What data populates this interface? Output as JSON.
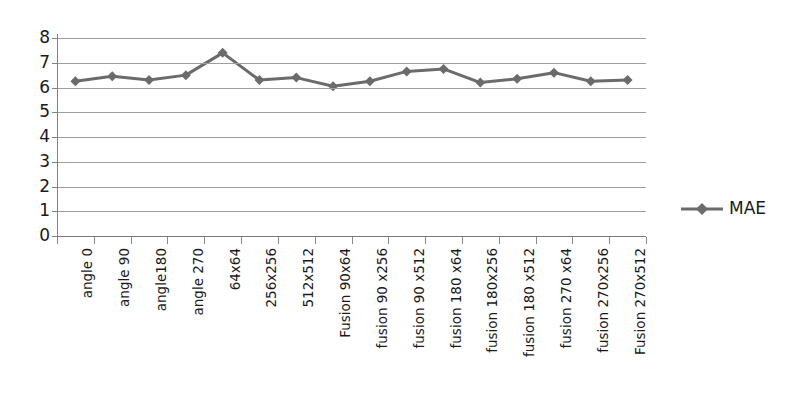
{
  "chart_data": {
    "type": "line",
    "title": "",
    "xlabel": "",
    "ylabel": "",
    "ylim": [
      0,
      8
    ],
    "ytick_labels": [
      "8",
      "7",
      "6",
      "5",
      "4",
      "3",
      "2",
      "1",
      "0"
    ],
    "yticks": [
      8,
      7,
      6,
      5,
      4,
      3,
      2,
      1,
      0
    ],
    "grid": true,
    "legend_position": "right",
    "marker": "diamond",
    "categories": [
      "angle 0",
      "angle 90",
      "angle180",
      "angle 270",
      "64x64",
      "256x256",
      "512x512",
      "Fusion 90x64",
      "fusion 90 x256",
      "fusion 90 x512",
      "fusion 180 x64",
      "fusion 180x256",
      "fusion 180 x512",
      "fusion 270 x64",
      "fusion 270x256",
      "Fusion 270x512"
    ],
    "series": [
      {
        "name": "MAE",
        "color": "#6b6b6b",
        "values": [
          6.25,
          6.45,
          6.3,
          6.5,
          7.4,
          6.3,
          6.4,
          6.05,
          6.25,
          6.65,
          6.75,
          6.2,
          6.35,
          6.6,
          6.25,
          6.3
        ]
      }
    ]
  },
  "legend": {
    "entries": [
      {
        "label": "MAE",
        "color": "#6b6b6b"
      }
    ]
  },
  "colors": {
    "series": "#6b6b6b",
    "grid": "#9e9e9e",
    "axis": "#808080",
    "text": "#1a1a1a",
    "background": "#ffffff"
  }
}
